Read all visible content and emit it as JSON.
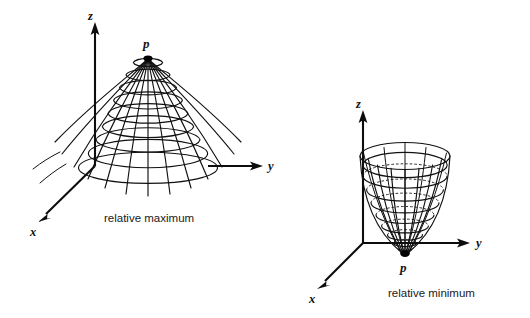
{
  "figure": {
    "background_color": "#ffffff",
    "ink_color": "#111111",
    "panels": [
      {
        "id": "relative-maximum",
        "caption": "relative maximum",
        "surface_type": "bell-shaped hill (dome)",
        "critical_point": {
          "label": "p",
          "position": "apex (top of dome)"
        },
        "axes": [
          {
            "name": "z",
            "label": "z",
            "direction": "up"
          },
          {
            "name": "y",
            "label": "y",
            "direction": "right"
          },
          {
            "name": "x",
            "label": "x",
            "direction": "down-left"
          }
        ],
        "mesh": {
          "meridians": 13,
          "contour_rings": 9
        }
      },
      {
        "id": "relative-minimum",
        "caption": "relative minimum",
        "surface_type": "cup / paraboloid bowl",
        "critical_point": {
          "label": "p",
          "position": "vertex (bottom of cup)"
        },
        "axes": [
          {
            "name": "z",
            "label": "z",
            "direction": "up"
          },
          {
            "name": "y",
            "label": "y",
            "direction": "right"
          },
          {
            "name": "x",
            "label": "x",
            "direction": "down-left"
          }
        ],
        "mesh": {
          "meridians": 13,
          "contour_rings": 9
        }
      }
    ]
  }
}
